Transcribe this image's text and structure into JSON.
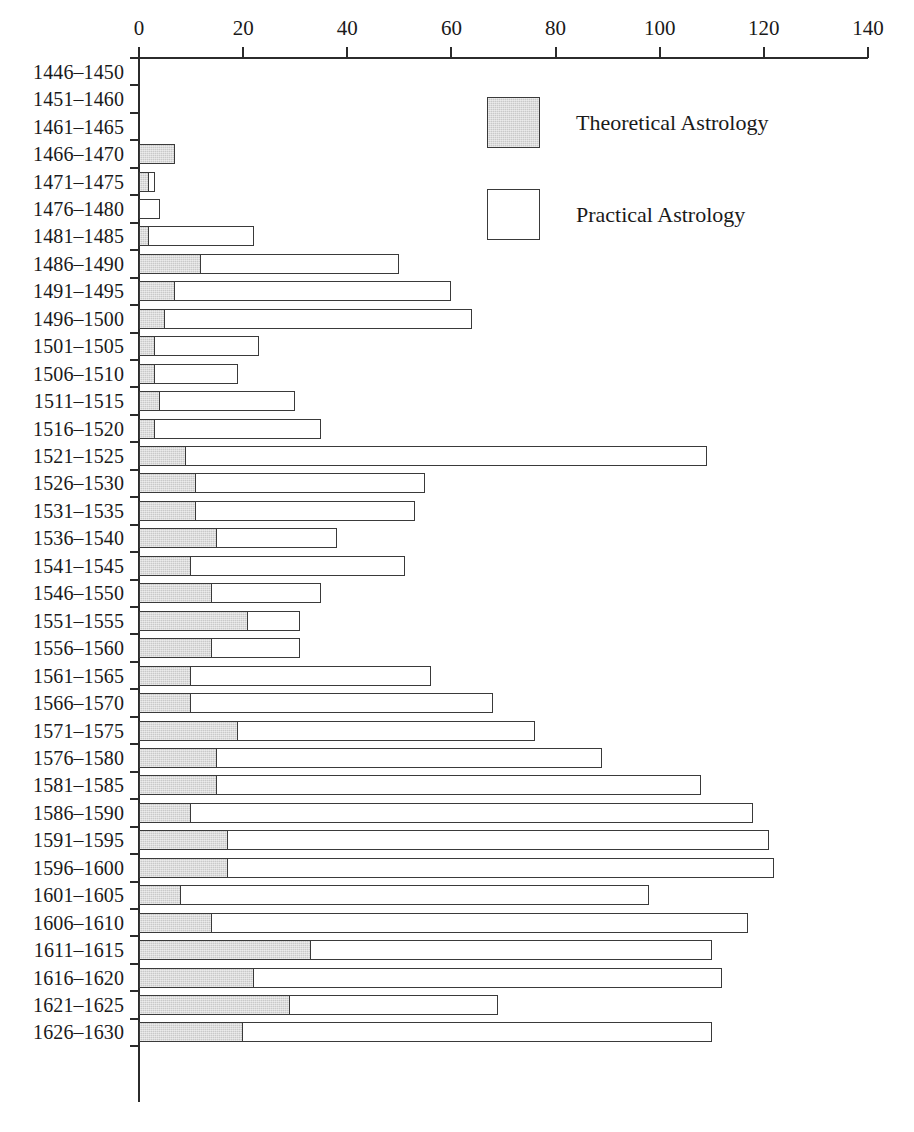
{
  "chart_data": {
    "type": "bar",
    "orientation": "horizontal",
    "stacked": true,
    "title": "",
    "subtitle": "",
    "xlabel": "",
    "ylabel": "",
    "xlim": [
      0,
      140
    ],
    "ylim": null,
    "grid": false,
    "legend_position": "inside-top-center",
    "xticks": [
      0,
      20,
      40,
      60,
      80,
      100,
      120,
      140
    ],
    "xtick_labels": [
      "0",
      "20",
      "40",
      "60",
      "80",
      "100",
      "120",
      "140"
    ],
    "categories": [
      "1446–1450",
      "1451–1460",
      "1461–1465",
      "1466–1470",
      "1471–1475",
      "1476–1480",
      "1481–1485",
      "1486–1490",
      "1491–1495",
      "1496–1500",
      "1501–1505",
      "1506–1510",
      "1511–1515",
      "1516–1520",
      "1521–1525",
      "1526–1530",
      "1531–1535",
      "1536–1540",
      "1541–1545",
      "1546–1550",
      "1551–1555",
      "1556–1560",
      "1561–1565",
      "1566–1570",
      "1571–1575",
      "1576–1580",
      "1581–1585",
      "1586–1590",
      "1591–1595",
      "1596–1600",
      "1601–1605",
      "1606–1610",
      "1611–1615",
      "1616–1620",
      "1621–1625",
      "1626–1630"
    ],
    "series": [
      {
        "name": "Theoretical Astrology",
        "color": "#c9c9c9",
        "values": [
          0,
          0,
          0,
          7,
          2,
          0,
          2,
          12,
          7,
          5,
          3,
          3,
          4,
          3,
          9,
          11,
          11,
          15,
          10,
          14,
          21,
          14,
          10,
          10,
          19,
          15,
          15,
          10,
          17,
          17,
          8,
          14,
          33,
          22,
          29,
          20
        ]
      },
      {
        "name": "Practical Astrology",
        "color": "#ffffff",
        "values": [
          0,
          0,
          0,
          0,
          1,
          4,
          20,
          38,
          53,
          59,
          20,
          16,
          26,
          32,
          100,
          44,
          42,
          23,
          41,
          21,
          10,
          17,
          46,
          58,
          57,
          74,
          93,
          108,
          104,
          105,
          90,
          103,
          77,
          90,
          40,
          90
        ]
      }
    ],
    "totals": [
      0,
      0,
      0,
      7,
      3,
      4,
      22,
      50,
      60,
      64,
      23,
      19,
      30,
      35,
      109,
      55,
      53,
      38,
      51,
      35,
      31,
      31,
      56,
      68,
      76,
      89,
      108,
      118,
      121,
      122,
      98,
      117,
      110,
      112,
      69,
      110
    ]
  },
  "legend": {
    "items": [
      {
        "label": "Theoretical Astrology",
        "swatch": "filled-gray"
      },
      {
        "label": "Practical Astrology",
        "swatch": "outline-white"
      }
    ]
  },
  "colors": {
    "theoretical": "#c9c9c9",
    "practical": "#ffffff",
    "stroke": "#3a3a3a",
    "axis": "#2b2b2b",
    "text": "#1a1a1a",
    "background": "#ffffff"
  }
}
